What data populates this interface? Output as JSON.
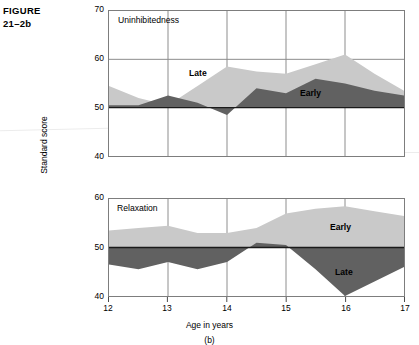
{
  "figure": {
    "label_line1": "FIGURE",
    "label_line2": "21–2b",
    "subfigure": "(b)"
  },
  "axes": {
    "y_title": "Standard score",
    "x_title": "Age in years",
    "x_ticks": [
      "12",
      "13",
      "14",
      "15",
      "16",
      "17"
    ],
    "upper_y_ticks": [
      "70",
      "60",
      "50",
      "40"
    ],
    "lower_y_ticks": [
      "60",
      "50",
      "40"
    ]
  },
  "colors": {
    "late_band": "#c9c9c9",
    "early_band": "#616161",
    "frame": "#7d7d7d",
    "gridline": "#8c8c8c",
    "baseline": "#1a1a1a",
    "text": "#000000",
    "background": "#ffffff"
  },
  "panels": {
    "upper": {
      "title": "Uninhibitedness",
      "label_light": "Late",
      "label_dark": "Early"
    },
    "lower": {
      "title": "Relaxation",
      "label_light": "Early",
      "label_dark": "Late"
    }
  },
  "chart_data": [
    {
      "type": "area",
      "title": "Uninhibitedness",
      "xlabel": "Age in years",
      "ylabel": "Standard score",
      "xlim": [
        12,
        17
      ],
      "ylim": [
        40,
        70
      ],
      "grid": true,
      "legend": "in-plot labels",
      "baseline": 50,
      "x": [
        12,
        12.5,
        13,
        13.5,
        14,
        14.5,
        15,
        15.5,
        16,
        16.5,
        17
      ],
      "series": [
        {
          "name": "Late",
          "color": "#c9c9c9",
          "values": [
            54.5,
            52.0,
            50.5,
            54.5,
            58.5,
            57.5,
            57.0,
            59.0,
            61.0,
            57.0,
            53.5
          ]
        },
        {
          "name": "Early",
          "color": "#616161",
          "values": [
            50.5,
            50.5,
            52.5,
            51.0,
            48.5,
            54.0,
            53.0,
            56.0,
            55.0,
            53.5,
            52.5
          ]
        }
      ]
    },
    {
      "type": "area",
      "title": "Relaxation",
      "xlabel": "Age in years",
      "ylabel": "Standard score",
      "xlim": [
        12,
        17
      ],
      "ylim": [
        40,
        70
      ],
      "grid": true,
      "legend": "in-plot labels",
      "baseline": 50,
      "x": [
        12,
        12.5,
        13,
        13.5,
        14,
        14.5,
        15,
        15.5,
        16,
        16.5,
        17
      ],
      "series": [
        {
          "name": "Early",
          "color": "#c9c9c9",
          "values": [
            53.5,
            54.0,
            54.5,
            53.0,
            53.0,
            54.0,
            57.0,
            58.0,
            58.5,
            57.5,
            56.5
          ]
        },
        {
          "name": "Late",
          "color": "#616161",
          "values": [
            46.5,
            45.5,
            47.0,
            45.5,
            47.0,
            51.0,
            50.5,
            45.5,
            40.0,
            43.0,
            46.0
          ]
        }
      ]
    }
  ]
}
